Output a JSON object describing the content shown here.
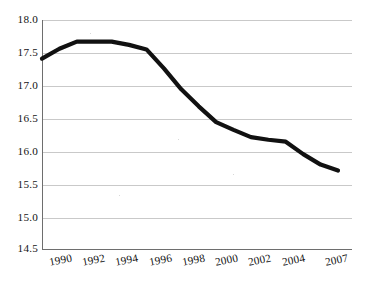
{
  "chart_data": {
    "type": "line",
    "title": "",
    "subtitle": "",
    "xlabel": "",
    "ylabel": "",
    "legend": [],
    "legend_position": "none",
    "grid": true,
    "grid_orientation": "horizontal",
    "ylim": [
      14.5,
      18.0
    ],
    "yticks": [
      "14.5",
      "15.0",
      "15.5",
      "16.0",
      "16.5",
      "17.0",
      "17.5",
      "18.0"
    ],
    "ytick_values": [
      14.5,
      15.0,
      15.5,
      16.0,
      16.5,
      17.0,
      17.5,
      18.0
    ],
    "categories": [
      "1990",
      "1992",
      "1994",
      "1996",
      "1998",
      "2000",
      "2002",
      "2004",
      "2007"
    ],
    "xticks": [
      "1990",
      "1992",
      "1994",
      "1996",
      "1998",
      "2000",
      "2002",
      "2004",
      "2007"
    ],
    "x": [
      1990,
      1992,
      1994,
      1996,
      1998,
      2000,
      2002,
      2004,
      2007
    ],
    "values": [
      17.41,
      17.67,
      17.67,
      17.55,
      16.94,
      16.44,
      16.21,
      16.14,
      15.7
    ],
    "series": [
      {
        "name": "",
        "color": "#111111",
        "x": [
          1990,
          1991,
          1992,
          1993,
          1994,
          1995,
          1996,
          1997,
          1998,
          1999,
          2000,
          2001,
          2002,
          2003,
          2004,
          2005,
          2006,
          2007
        ],
        "values": [
          17.41,
          17.56,
          17.67,
          17.67,
          17.67,
          17.62,
          17.55,
          17.26,
          16.94,
          16.68,
          16.44,
          16.32,
          16.21,
          16.17,
          16.14,
          15.95,
          15.79,
          15.7
        ]
      }
    ],
    "annotations": []
  },
  "style": {
    "background": "#ffffff",
    "line_color": "#111111",
    "grid_color": "#c9c9c9",
    "axis_color": "#6e6e6e",
    "text_color": "#141414"
  }
}
